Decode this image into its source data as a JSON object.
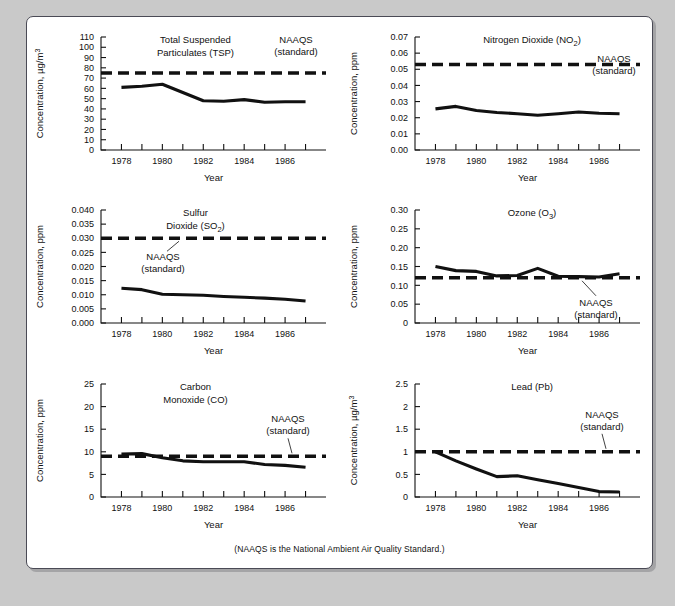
{
  "figure": {
    "footnote": "(NAAQS is the National Ambient Air Quality Standard.)",
    "x_axis_title": "Year",
    "naaqs_label_line1": "NAAQS",
    "naaqs_label_line2": "(standard)"
  },
  "chart_data": [
    {
      "id": "tsp",
      "type": "line",
      "title": "Total Suspended\nParticulates (TSP)",
      "title_lines": [
        "Total Suspended",
        "Particulates (TSP)"
      ],
      "xlabel": "Year",
      "ylabel": "Concentration, µg/m³",
      "x": [
        1978,
        1979,
        1980,
        1981,
        1982,
        1983,
        1984,
        1985,
        1986,
        1987
      ],
      "values": [
        61,
        62,
        64,
        56,
        48,
        47.5,
        49,
        46.5,
        47,
        47
      ],
      "standard": 75,
      "standard_label": "NAAQS (standard)",
      "xlim": [
        1977,
        1988
      ],
      "ylim": [
        0,
        110
      ],
      "yticks": [
        0,
        10,
        20,
        30,
        40,
        50,
        60,
        70,
        80,
        90,
        100,
        110
      ],
      "ytick_labels": [
        "0",
        "10",
        "20",
        "30",
        "40",
        "50",
        "60",
        "70",
        "80",
        "90",
        "100",
        "110"
      ],
      "xticks": [
        1978,
        1979,
        1980,
        1981,
        1982,
        1983,
        1984,
        1985,
        1986,
        1987
      ],
      "xtick_labels": [
        "1978",
        "",
        "1980",
        "",
        "1982",
        "",
        "1984",
        "",
        "1986",
        ""
      ],
      "grid": false,
      "naaqs_anchor": "top-right",
      "leader": false
    },
    {
      "id": "no2",
      "type": "line",
      "title": "Nitrogen Dioxide (NO2)",
      "title_lines": [
        "Nitrogen Dioxide (NO₂)"
      ],
      "xlabel": "Year",
      "ylabel": "Concentration, ppm",
      "x": [
        1978,
        1979,
        1980,
        1981,
        1982,
        1983,
        1984,
        1985,
        1986,
        1987
      ],
      "values": [
        0.0255,
        0.027,
        0.0245,
        0.0232,
        0.0225,
        0.0215,
        0.0225,
        0.0235,
        0.0228,
        0.0225
      ],
      "standard": 0.053,
      "standard_label": "NAAQS (standard)",
      "xlim": [
        1977,
        1988
      ],
      "ylim": [
        0,
        0.07
      ],
      "yticks": [
        0,
        0.01,
        0.02,
        0.03,
        0.04,
        0.05,
        0.06,
        0.07
      ],
      "ytick_labels": [
        "0.00",
        "0.01",
        "0.02",
        "0.03",
        "0.04",
        "0.05",
        "0.06",
        "0.07"
      ],
      "xticks": [
        1978,
        1979,
        1980,
        1981,
        1982,
        1983,
        1984,
        1985,
        1986,
        1987
      ],
      "xtick_labels": [
        "1978",
        "",
        "1980",
        "",
        "1982",
        "",
        "1984",
        "",
        "1986",
        ""
      ],
      "grid": false,
      "naaqs_anchor": "right",
      "leader": false
    },
    {
      "id": "so2",
      "type": "line",
      "title": "Sulfur Dioxide (SO2)",
      "title_lines": [
        "Sulfur",
        "Dioxide (SO₂)"
      ],
      "xlabel": "Year",
      "ylabel": "Concentration, ppm",
      "x": [
        1978,
        1979,
        1980,
        1981,
        1982,
        1983,
        1984,
        1985,
        1986,
        1987
      ],
      "values": [
        0.0123,
        0.0118,
        0.0102,
        0.01,
        0.0098,
        0.0094,
        0.0091,
        0.0088,
        0.0084,
        0.0078
      ],
      "standard": 0.03,
      "standard_label": "NAAQS (standard)",
      "xlim": [
        1977,
        1988
      ],
      "ylim": [
        0,
        0.04
      ],
      "yticks": [
        0,
        0.005,
        0.01,
        0.015,
        0.02,
        0.025,
        0.03,
        0.035,
        0.04
      ],
      "ytick_labels": [
        "0.000",
        "0.005",
        "0.010",
        "0.015",
        "0.020",
        "0.025",
        "0.030",
        "0.035",
        "0.040"
      ],
      "xticks": [
        1978,
        1979,
        1980,
        1981,
        1982,
        1983,
        1984,
        1985,
        1986,
        1987
      ],
      "xtick_labels": [
        "1978",
        "",
        "1980",
        "",
        "1982",
        "",
        "1984",
        "",
        "1986",
        ""
      ],
      "grid": false,
      "naaqs_anchor": "below-left",
      "leader": true
    },
    {
      "id": "ozone",
      "type": "line",
      "title": "Ozone (O3)",
      "title_lines": [
        "Ozone (O₃)"
      ],
      "xlabel": "Year",
      "ylabel": "Concentration, ppm",
      "x": [
        1978,
        1979,
        1980,
        1981,
        1982,
        1983,
        1984,
        1985,
        1986,
        1987
      ],
      "values": [
        0.15,
        0.139,
        0.137,
        0.125,
        0.126,
        0.145,
        0.124,
        0.123,
        0.122,
        0.131
      ],
      "standard": 0.12,
      "standard_label": "NAAQS (standard)",
      "xlim": [
        1977,
        1988
      ],
      "ylim": [
        0,
        0.3
      ],
      "yticks": [
        0,
        0.05,
        0.1,
        0.15,
        0.2,
        0.25,
        0.3
      ],
      "ytick_labels": [
        "0",
        "0.05",
        "0.10",
        "0.15",
        "0.20",
        "0.25",
        "0.30"
      ],
      "xticks": [
        1978,
        1979,
        1980,
        1981,
        1982,
        1983,
        1984,
        1985,
        1986,
        1987
      ],
      "xtick_labels": [
        "1978",
        "",
        "1980",
        "",
        "1982",
        "",
        "1984",
        "",
        "1986",
        ""
      ],
      "grid": false,
      "naaqs_anchor": "below-right",
      "leader": true
    },
    {
      "id": "co",
      "type": "line",
      "title": "Carbon Monoxide (CO)",
      "title_lines": [
        "Carbon",
        "Monoxide (CO)"
      ],
      "xlabel": "Year",
      "ylabel": "Concentration, ppm",
      "x": [
        1978,
        1979,
        1980,
        1981,
        1982,
        1983,
        1984,
        1985,
        1986,
        1987
      ],
      "values": [
        9.5,
        9.6,
        8.7,
        8.0,
        7.8,
        7.8,
        7.8,
        7.2,
        7.0,
        6.6
      ],
      "standard": 9.0,
      "standard_label": "NAAQS (standard)",
      "xlim": [
        1977,
        1988
      ],
      "ylim": [
        0,
        25
      ],
      "yticks": [
        0,
        5,
        10,
        15,
        20,
        25
      ],
      "ytick_labels": [
        "0",
        "5",
        "10",
        "15",
        "20",
        "25"
      ],
      "xticks": [
        1978,
        1979,
        1980,
        1981,
        1982,
        1983,
        1984,
        1985,
        1986,
        1987
      ],
      "xtick_labels": [
        "1978",
        "",
        "1980",
        "",
        "1982",
        "",
        "1984",
        "",
        "1986",
        ""
      ],
      "grid": false,
      "naaqs_anchor": "above-right",
      "leader": true
    },
    {
      "id": "lead",
      "type": "line",
      "title": "Lead (Pb)",
      "title_lines": [
        "Lead (Pb)"
      ],
      "xlabel": "Year",
      "ylabel": "Concentration, µg/m³",
      "x": [
        1978,
        1979,
        1980,
        1981,
        1982,
        1983,
        1984,
        1985,
        1986,
        1987
      ],
      "values": [
        1.0,
        0.8,
        0.62,
        0.45,
        0.47,
        0.38,
        0.3,
        0.21,
        0.12,
        0.11
      ],
      "standard": 1.0,
      "standard_label": "NAAQS (standard)",
      "xlim": [
        1977,
        1988
      ],
      "ylim": [
        0,
        2.5
      ],
      "yticks": [
        0,
        0.5,
        1,
        1.5,
        2,
        2.5
      ],
      "ytick_labels": [
        "0",
        "0.5",
        "1",
        "1.5",
        "2",
        "2.5"
      ],
      "xticks": [
        1978,
        1979,
        1980,
        1981,
        1982,
        1983,
        1984,
        1985,
        1986,
        1987
      ],
      "xtick_labels": [
        "1978",
        "",
        "1980",
        "",
        "1982",
        "",
        "1984",
        "",
        "1986",
        ""
      ],
      "grid": false,
      "naaqs_anchor": "above-right",
      "leader": true
    }
  ],
  "colors": {
    "ink": "#111111",
    "paper": "#ffffff",
    "page_background": "#c9c9c9",
    "frame_border": "#4a4a55"
  }
}
